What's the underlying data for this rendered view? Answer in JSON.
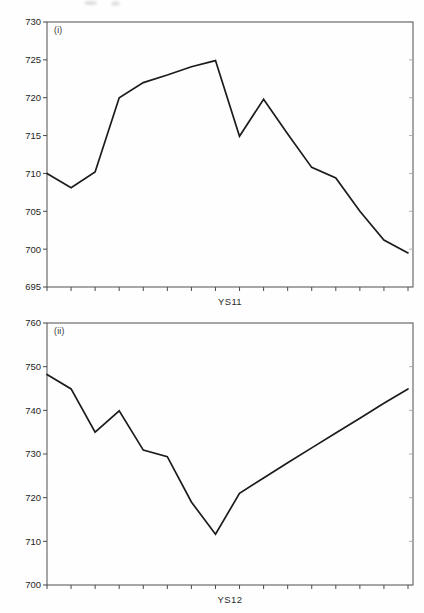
{
  "chart_data": [
    {
      "type": "line",
      "panel_label": "(i)",
      "series_name": "YS11",
      "xlabel": "YS11",
      "ylabel": "",
      "x": [
        1,
        2,
        3,
        4,
        5,
        6,
        7,
        8,
        9,
        10,
        11,
        12,
        13,
        14,
        15,
        16
      ],
      "values": [
        710,
        708.1,
        710.2,
        720,
        722,
        723,
        724.1,
        724.9,
        714.9,
        719.8,
        715.2,
        710.8,
        709.4,
        705,
        701.2,
        699.5
      ],
      "ylim": [
        695,
        730
      ],
      "yticks": [
        695,
        700,
        705,
        710,
        715,
        720,
        725,
        730
      ],
      "x_tick_count": 16,
      "x_ticks_labeled": false,
      "grid": false,
      "legend": "none",
      "line_color": "#1c1c1c",
      "frame_color": "#4f4f4f"
    },
    {
      "type": "line",
      "panel_label": "(ii)",
      "series_name": "YS12",
      "xlabel": "YS12",
      "ylabel": "",
      "x": [
        1,
        2,
        3,
        4,
        5,
        6,
        7,
        8,
        9,
        10,
        11,
        12,
        13,
        14,
        15,
        16
      ],
      "values": [
        748.2,
        744.9,
        735,
        739.9,
        730.9,
        729.4,
        719,
        711.6,
        721,
        724.5,
        728,
        731.4,
        734.8,
        738.2,
        741.6,
        744.9
      ],
      "ylim": [
        700,
        760
      ],
      "yticks": [
        700,
        710,
        720,
        730,
        740,
        750,
        760
      ],
      "x_tick_count": 16,
      "x_ticks_labeled": false,
      "grid": false,
      "legend": "none",
      "line_color": "#1c1c1c",
      "frame_color": "#4f4f4f"
    }
  ]
}
